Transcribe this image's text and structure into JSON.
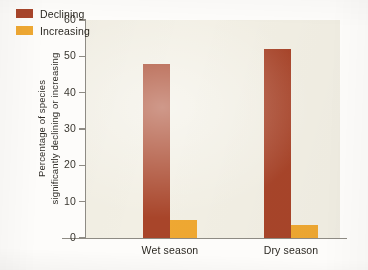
{
  "chart_data": {
    "type": "bar",
    "title": "",
    "subtitle": "",
    "xlabel": "",
    "ylabel": "Percentage of species significantly declining or increasing",
    "ylabel_lines": [
      "Percentage of species",
      "significantly declining or increasing"
    ],
    "categories": [
      "Wet season",
      "Dry season"
    ],
    "series": [
      {
        "name": "Declining",
        "color": "#a8452a",
        "values": [
          48,
          52
        ]
      },
      {
        "name": "Increasing",
        "color": "#efa832",
        "values": [
          5,
          3.5
        ]
      }
    ],
    "ylim": [
      0,
      60
    ],
    "y_ticks": [
      0,
      10,
      20,
      30,
      40,
      50,
      60
    ],
    "y_tick_labels": [
      "0",
      "10",
      "20",
      "30",
      "40",
      "50",
      "60"
    ],
    "grid": false,
    "legend_position": "top-left",
    "plot_background": "#f2efe4",
    "axis_color": "#8e8b84"
  },
  "legend": {
    "items": [
      {
        "label": "Declining",
        "color": "#a8452a"
      },
      {
        "label": "Increasing",
        "color": "#efa832"
      }
    ]
  }
}
